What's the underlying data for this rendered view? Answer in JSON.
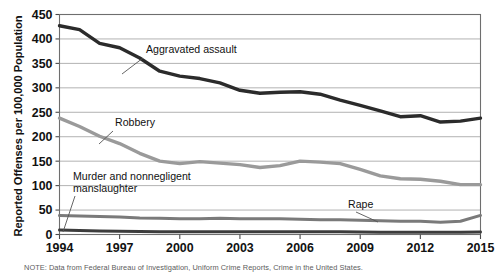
{
  "chart_data": {
    "type": "line",
    "title": "",
    "xlabel": "",
    "ylabel": "Reported Offenses per 100,000 Population",
    "xlim": [
      1994,
      2015
    ],
    "ylim": [
      0,
      450
    ],
    "ytick_step": 50,
    "grid": true,
    "legend_position": "inline-labels",
    "yticks": [
      "0",
      "50",
      "100",
      "150",
      "200",
      "250",
      "300",
      "350",
      "400",
      "450"
    ],
    "xticks": [
      "1994",
      "1997",
      "2000",
      "2003",
      "2006",
      "2009",
      "2012",
      "2015"
    ],
    "x": [
      1994,
      1995,
      1996,
      1997,
      1998,
      1999,
      2000,
      2001,
      2002,
      2003,
      2004,
      2005,
      2006,
      2007,
      2008,
      2009,
      2010,
      2011,
      2012,
      2013,
      2014,
      2015
    ],
    "series": [
      {
        "name": "Aggravated assault",
        "color": "#2b2b2b",
        "width": 3.4,
        "values": [
          427,
          419,
          391,
          382,
          361,
          334,
          324,
          319,
          310,
          295,
          289,
          291,
          292,
          287,
          275,
          264,
          253,
          241,
          243,
          230,
          232,
          238
        ]
      },
      {
        "name": "Robbery",
        "color": "#9a9a9a",
        "width": 3.4,
        "values": [
          238,
          221,
          201,
          186,
          166,
          150,
          145,
          149,
          146,
          143,
          137,
          141,
          150,
          148,
          145,
          133,
          120,
          114,
          113,
          109,
          102,
          102
        ]
      },
      {
        "name": "Rape",
        "color": "#7a7a7a",
        "width": 3.0,
        "values": [
          39,
          38,
          37,
          36,
          34,
          33,
          32,
          32,
          33,
          32,
          32,
          32,
          31,
          30,
          30,
          29,
          28,
          27,
          27,
          25,
          27,
          39
        ]
      },
      {
        "name": "Murder and nonnegligent manslaughter",
        "color": "#3c3c3c",
        "width": 3.0,
        "values": [
          9,
          8.2,
          7.4,
          6.8,
          6.3,
          5.7,
          5.5,
          5.6,
          5.6,
          5.7,
          5.5,
          5.6,
          5.8,
          5.7,
          5.4,
          5.0,
          4.8,
          4.7,
          4.7,
          4.5,
          4.5,
          4.9
        ]
      }
    ],
    "annotations": [
      {
        "name": "aggravated-assault-label",
        "text": "Aggravated assault",
        "label_xy": [
          146,
          53
        ],
        "leader": [
          [
            143,
            58
          ],
          [
            122,
            74
          ]
        ]
      },
      {
        "name": "robbery-label",
        "text": "Robbery",
        "label_xy": [
          115,
          126
        ],
        "leader": [
          [
            113,
            131
          ],
          [
            99,
            144
          ]
        ]
      },
      {
        "name": "murder-label-line1",
        "text": "Murder and nonnegligent",
        "label_xy": [
          73,
          180
        ],
        "leader": [
          [
            75,
            196
          ],
          [
            63,
            232
          ]
        ]
      },
      {
        "name": "murder-label-line2",
        "text": "manslaughter",
        "label_xy": [
          73,
          192
        ],
        "leader": null
      },
      {
        "name": "rape-label",
        "text": "Rape",
        "label_xy": [
          348,
          208
        ],
        "leader": [
          [
            356,
            212
          ],
          [
            378,
            222
          ]
        ]
      }
    ],
    "note": "NOTE: Data from Federal Bureau of Investigation, Uniform Crime Reports, Crime in the United States."
  }
}
